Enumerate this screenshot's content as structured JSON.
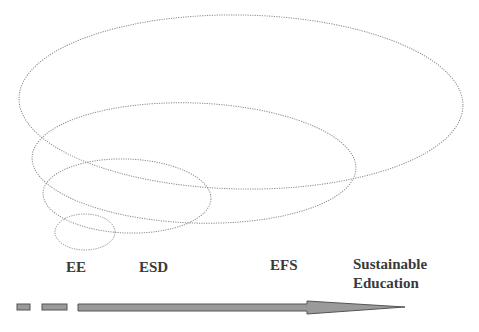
{
  "diagram": {
    "type": "nested-ellipses-progression",
    "ellipses": [
      {
        "name": "sustainable-education",
        "cx": 241,
        "cy": 102,
        "rx": 222,
        "ry": 87
      },
      {
        "name": "efs",
        "cx": 194,
        "cy": 163,
        "rx": 162,
        "ry": 60
      },
      {
        "name": "esd",
        "cx": 127,
        "cy": 196,
        "rx": 84,
        "ry": 37
      },
      {
        "name": "ee",
        "cx": 85,
        "cy": 232,
        "rx": 30,
        "ry": 18
      }
    ],
    "labels": {
      "ee": "EE",
      "esd": "ESD",
      "efs": "EFS",
      "se_line1": "Sustainable",
      "se_line2": "Education"
    },
    "colors": {
      "ellipse_stroke": "#8a8a8a",
      "arrow_fill": "#9a9a9a",
      "arrow_stroke": "#555555",
      "label_text": "#3a3a3a"
    }
  }
}
